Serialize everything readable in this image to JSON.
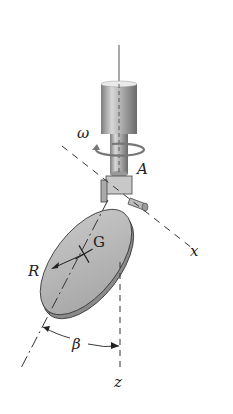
{
  "diagram": {
    "labels": {
      "omega": "ω",
      "point_a": "A",
      "center": "G",
      "radius": "R",
      "angle": "β",
      "x_axis": "x",
      "z_axis": "z"
    },
    "colors": {
      "shaft": "#9a9a9a",
      "disc_face": "#b8b8b8",
      "disc_edge": "#8a8a8a",
      "lines": "#333333"
    }
  }
}
